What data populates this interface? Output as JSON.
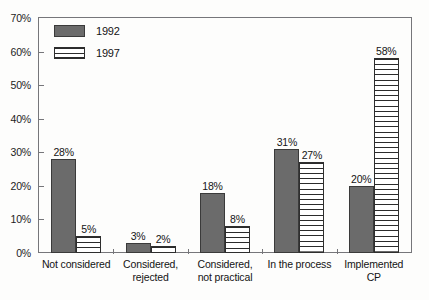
{
  "chart_data": {
    "type": "bar",
    "title": "",
    "subtitle": "",
    "xlabel": "",
    "ylabel": "",
    "ylim": [
      0,
      70
    ],
    "ytick_labels": [
      "0%",
      "10%",
      "20%",
      "30%",
      "40%",
      "50%",
      "60%",
      "70%"
    ],
    "ytick_values": [
      0,
      10,
      20,
      30,
      40,
      50,
      60,
      70
    ],
    "grid": false,
    "legend_position": "top-left-inside",
    "categories": [
      "Not considered",
      "Considered,\nrejected",
      "Considered,\nnot practical",
      "In the process",
      "Implemented\nCP"
    ],
    "category_lines": [
      [
        "Not considered"
      ],
      [
        "Considered,",
        "rejected"
      ],
      [
        "Considered,",
        "not practical"
      ],
      [
        "In the process"
      ],
      [
        "Implemented",
        "CP"
      ]
    ],
    "series": [
      {
        "name": "1992",
        "color": "#6b6b6b",
        "pattern": "solid",
        "values": [
          28,
          3,
          18,
          31,
          20
        ],
        "data_labels": [
          "28%",
          "3%",
          "18%",
          "31%",
          "20%"
        ]
      },
      {
        "name": "1997",
        "color": "#ffffff",
        "pattern": "horizontal-stripes",
        "values": [
          5,
          2,
          8,
          27,
          58
        ],
        "data_labels": [
          "5%",
          "2%",
          "8%",
          "27%",
          "58%"
        ]
      }
    ]
  },
  "legend": {
    "items": [
      {
        "label": "1992",
        "swatch": "solid-gray-swatch"
      },
      {
        "label": "1997",
        "swatch": "striped-swatch"
      }
    ]
  },
  "colors": {
    "series_1992": "#6b6b6b",
    "series_1997": "#ffffff",
    "stripe": "#2b2b2b",
    "axis": "#76767a",
    "text": "#141414",
    "background": "#fdfdfc"
  }
}
